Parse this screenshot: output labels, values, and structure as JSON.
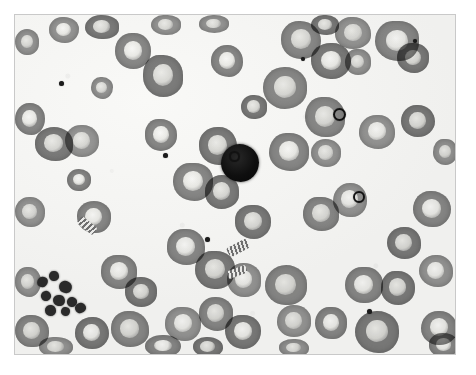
{
  "image": {
    "kind": "micrograph",
    "subject": "peripheral blood smear",
    "modality": "brightfield light microscopy",
    "rendering": "grayscale",
    "caption": "",
    "title": "",
    "frame": {
      "margin_px": 14,
      "border_color": "#c9c9c9",
      "page_background": "#ffffff"
    }
  },
  "palette": {
    "page_background": "#ffffff",
    "field_background": "#f3f3f1",
    "erythrocyte_body": "#8d8d8d",
    "erythrocyte_body_light": "#9b9b9b",
    "erythrocyte_body_dark": "#7f7f7f",
    "central_pallor": "#e8e8e6",
    "highlight": "#ffffff",
    "dark_cell_nucleus": "#0d0d0d",
    "platelet": "#2c2c2c",
    "inclusion": "#1d1d1d",
    "frame_border": "#c9c9c9"
  },
  "features": {
    "dark_nucleated_cell": {
      "label": "dark-nucleated-cell",
      "x": 206,
      "y": 129,
      "w": 38,
      "h": 38
    },
    "platelet_clump": {
      "label": "platelet-clump",
      "x": 20,
      "y": 256,
      "w": 52,
      "h": 42,
      "count": 9
    },
    "erythrocyte_count_visible": 64,
    "inclusion_bodies_visible": 7,
    "rouleaux_groups_visible": 3
  },
  "erythrocytes": [
    {
      "x": 34,
      "y": 2,
      "w": 30,
      "h": 26,
      "tone": "pale",
      "pallor": "bright"
    },
    {
      "x": 70,
      "y": 0,
      "w": 34,
      "h": 24,
      "tone": "dim",
      "pallor": "normal"
    },
    {
      "x": 136,
      "y": 0,
      "w": 30,
      "h": 20,
      "tone": "pale",
      "pallor": "normal"
    },
    {
      "x": 184,
      "y": 0,
      "w": 30,
      "h": 18,
      "tone": "pale",
      "pallor": "normal"
    },
    {
      "x": 296,
      "y": 0,
      "w": 28,
      "h": 20,
      "tone": "dim",
      "pallor": "normal"
    },
    {
      "x": 0,
      "y": 14,
      "w": 24,
      "h": 26,
      "tone": "pale",
      "pallor": "normal"
    },
    {
      "x": 100,
      "y": 18,
      "w": 36,
      "h": 36,
      "tone": "normal",
      "pallor": "bright"
    },
    {
      "x": 128,
      "y": 40,
      "w": 40,
      "h": 42,
      "tone": "dim",
      "pallor": "normal"
    },
    {
      "x": 196,
      "y": 30,
      "w": 32,
      "h": 32,
      "tone": "normal",
      "pallor": "bright"
    },
    {
      "x": 266,
      "y": 6,
      "w": 40,
      "h": 38,
      "tone": "normal",
      "pallor": "normal"
    },
    {
      "x": 296,
      "y": 28,
      "w": 40,
      "h": 36,
      "tone": "dim",
      "pallor": "bright"
    },
    {
      "x": 320,
      "y": 2,
      "w": 36,
      "h": 32,
      "tone": "pale",
      "pallor": "normal"
    },
    {
      "x": 360,
      "y": 6,
      "w": 44,
      "h": 40,
      "tone": "normal",
      "pallor": "bright"
    },
    {
      "x": 382,
      "y": 28,
      "w": 32,
      "h": 30,
      "tone": "dim",
      "pallor": "normal"
    },
    {
      "x": 330,
      "y": 34,
      "w": 26,
      "h": 26,
      "tone": "pale",
      "pallor": "normal"
    },
    {
      "x": 248,
      "y": 52,
      "w": 44,
      "h": 42,
      "tone": "normal",
      "pallor": "normal"
    },
    {
      "x": 0,
      "y": 88,
      "w": 30,
      "h": 32,
      "tone": "normal",
      "pallor": "bright"
    },
    {
      "x": 20,
      "y": 112,
      "w": 38,
      "h": 34,
      "tone": "dim",
      "pallor": "normal"
    },
    {
      "x": 50,
      "y": 110,
      "w": 34,
      "h": 32,
      "tone": "pale",
      "pallor": "normal"
    },
    {
      "x": 130,
      "y": 104,
      "w": 32,
      "h": 32,
      "tone": "normal",
      "pallor": "bright"
    },
    {
      "x": 184,
      "y": 112,
      "w": 38,
      "h": 38,
      "tone": "dim",
      "pallor": "normal"
    },
    {
      "x": 290,
      "y": 82,
      "w": 40,
      "h": 40,
      "tone": "normal",
      "pallor": "normal"
    },
    {
      "x": 344,
      "y": 100,
      "w": 36,
      "h": 34,
      "tone": "pale",
      "pallor": "bright"
    },
    {
      "x": 386,
      "y": 90,
      "w": 34,
      "h": 32,
      "tone": "dim",
      "pallor": "normal"
    },
    {
      "x": 254,
      "y": 118,
      "w": 40,
      "h": 38,
      "tone": "normal",
      "pallor": "bright"
    },
    {
      "x": 296,
      "y": 124,
      "w": 30,
      "h": 28,
      "tone": "pale",
      "pallor": "normal"
    },
    {
      "x": 158,
      "y": 148,
      "w": 40,
      "h": 38,
      "tone": "normal",
      "pallor": "bright"
    },
    {
      "x": 190,
      "y": 160,
      "w": 34,
      "h": 34,
      "tone": "dim",
      "pallor": "normal"
    },
    {
      "x": 0,
      "y": 182,
      "w": 30,
      "h": 30,
      "tone": "pale",
      "pallor": "normal"
    },
    {
      "x": 62,
      "y": 186,
      "w": 34,
      "h": 32,
      "tone": "normal",
      "pallor": "bright"
    },
    {
      "x": 220,
      "y": 190,
      "w": 36,
      "h": 34,
      "tone": "dim",
      "pallor": "normal"
    },
    {
      "x": 288,
      "y": 182,
      "w": 36,
      "h": 34,
      "tone": "normal",
      "pallor": "normal"
    },
    {
      "x": 318,
      "y": 168,
      "w": 34,
      "h": 34,
      "tone": "pale",
      "pallor": "bright"
    },
    {
      "x": 398,
      "y": 176,
      "w": 38,
      "h": 36,
      "tone": "normal",
      "pallor": "bright"
    },
    {
      "x": 372,
      "y": 212,
      "w": 34,
      "h": 32,
      "tone": "dim",
      "pallor": "normal"
    },
    {
      "x": 152,
      "y": 214,
      "w": 38,
      "h": 36,
      "tone": "normal",
      "pallor": "bright"
    },
    {
      "x": 180,
      "y": 236,
      "w": 40,
      "h": 38,
      "tone": "dim",
      "pallor": "normal"
    },
    {
      "x": 212,
      "y": 248,
      "w": 34,
      "h": 34,
      "tone": "pale",
      "pallor": "bright"
    },
    {
      "x": 86,
      "y": 240,
      "w": 36,
      "h": 34,
      "tone": "normal",
      "pallor": "bright"
    },
    {
      "x": 110,
      "y": 262,
      "w": 32,
      "h": 30,
      "tone": "dim",
      "pallor": "normal"
    },
    {
      "x": 0,
      "y": 252,
      "w": 26,
      "h": 30,
      "tone": "pale",
      "pallor": "normal"
    },
    {
      "x": 250,
      "y": 250,
      "w": 42,
      "h": 40,
      "tone": "normal",
      "pallor": "normal"
    },
    {
      "x": 330,
      "y": 252,
      "w": 38,
      "h": 36,
      "tone": "normal",
      "pallor": "bright"
    },
    {
      "x": 366,
      "y": 256,
      "w": 34,
      "h": 34,
      "tone": "dim",
      "pallor": "normal"
    },
    {
      "x": 404,
      "y": 240,
      "w": 34,
      "h": 32,
      "tone": "pale",
      "pallor": "bright"
    },
    {
      "x": 0,
      "y": 300,
      "w": 34,
      "h": 32,
      "tone": "normal",
      "pallor": "normal"
    },
    {
      "x": 60,
      "y": 302,
      "w": 34,
      "h": 32,
      "tone": "dim",
      "pallor": "bright"
    },
    {
      "x": 96,
      "y": 296,
      "w": 38,
      "h": 36,
      "tone": "normal",
      "pallor": "normal"
    },
    {
      "x": 150,
      "y": 292,
      "w": 36,
      "h": 34,
      "tone": "pale",
      "pallor": "bright"
    },
    {
      "x": 184,
      "y": 282,
      "w": 34,
      "h": 34,
      "tone": "normal",
      "pallor": "normal"
    },
    {
      "x": 210,
      "y": 300,
      "w": 36,
      "h": 34,
      "tone": "dim",
      "pallor": "bright"
    },
    {
      "x": 262,
      "y": 290,
      "w": 34,
      "h": 32,
      "tone": "pale",
      "pallor": "normal"
    },
    {
      "x": 300,
      "y": 292,
      "w": 32,
      "h": 32,
      "tone": "normal",
      "pallor": "bright"
    },
    {
      "x": 340,
      "y": 296,
      "w": 44,
      "h": 42,
      "tone": "dim",
      "pallor": "normal"
    },
    {
      "x": 406,
      "y": 296,
      "w": 36,
      "h": 34,
      "tone": "normal",
      "pallor": "bright"
    },
    {
      "x": 24,
      "y": 322,
      "w": 34,
      "h": 20,
      "tone": "pale",
      "pallor": "normal"
    },
    {
      "x": 130,
      "y": 320,
      "w": 36,
      "h": 22,
      "tone": "normal",
      "pallor": "bright"
    },
    {
      "x": 178,
      "y": 322,
      "w": 30,
      "h": 20,
      "tone": "dim",
      "pallor": "normal"
    },
    {
      "x": 264,
      "y": 324,
      "w": 30,
      "h": 18,
      "tone": "pale",
      "pallor": "normal"
    },
    {
      "x": 414,
      "y": 318,
      "w": 30,
      "h": 24,
      "tone": "normal",
      "pallor": "bright"
    },
    {
      "x": 76,
      "y": 62,
      "w": 22,
      "h": 22,
      "tone": "pale",
      "pallor": "normal"
    },
    {
      "x": 226,
      "y": 80,
      "w": 26,
      "h": 24,
      "tone": "dim",
      "pallor": "normal"
    },
    {
      "x": 418,
      "y": 124,
      "w": 24,
      "h": 26,
      "tone": "pale",
      "pallor": "normal"
    },
    {
      "x": 52,
      "y": 154,
      "w": 24,
      "h": 22,
      "tone": "normal",
      "pallor": "bright"
    }
  ],
  "inclusions": [
    {
      "x": 214,
      "y": 136,
      "d": 7,
      "style": "ring"
    },
    {
      "x": 148,
      "y": 138,
      "d": 5,
      "style": "solid"
    },
    {
      "x": 44,
      "y": 66,
      "d": 5,
      "style": "solid"
    },
    {
      "x": 318,
      "y": 93,
      "d": 9,
      "style": "ring"
    },
    {
      "x": 338,
      "y": 176,
      "d": 8,
      "style": "ring"
    },
    {
      "x": 352,
      "y": 294,
      "d": 5,
      "style": "solid"
    },
    {
      "x": 190,
      "y": 222,
      "d": 5,
      "style": "solid"
    },
    {
      "x": 286,
      "y": 42,
      "d": 4,
      "style": "solid"
    },
    {
      "x": 398,
      "y": 24,
      "d": 4,
      "style": "solid"
    }
  ],
  "platelets": [
    {
      "x": 22,
      "y": 262,
      "w": 11,
      "h": 10
    },
    {
      "x": 34,
      "y": 256,
      "w": 10,
      "h": 10
    },
    {
      "x": 44,
      "y": 266,
      "w": 13,
      "h": 12
    },
    {
      "x": 26,
      "y": 276,
      "w": 10,
      "h": 10
    },
    {
      "x": 38,
      "y": 280,
      "w": 12,
      "h": 11
    },
    {
      "x": 52,
      "y": 282,
      "w": 10,
      "h": 10
    },
    {
      "x": 30,
      "y": 290,
      "w": 11,
      "h": 11
    },
    {
      "x": 46,
      "y": 292,
      "w": 9,
      "h": 9
    },
    {
      "x": 60,
      "y": 288,
      "w": 11,
      "h": 10
    }
  ],
  "rouleaux": [
    {
      "x": 212,
      "y": 228,
      "w": 22,
      "h": 10,
      "rot": -28
    },
    {
      "x": 212,
      "y": 253,
      "w": 20,
      "h": 8,
      "rot": -20
    },
    {
      "x": 62,
      "y": 206,
      "w": 20,
      "h": 9,
      "rot": 38
    }
  ]
}
